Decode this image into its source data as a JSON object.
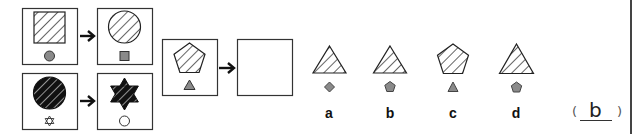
{
  "puzzle": {
    "type": "figure-reasoning",
    "examples": [
      {
        "source": {
          "main_shape": "square",
          "main_fill": "hatched",
          "small_shape": "circle",
          "small_fill": "gray"
        },
        "target": {
          "main_shape": "circle",
          "main_fill": "hatched",
          "small_shape": "square",
          "small_fill": "gray"
        }
      },
      {
        "source": {
          "main_shape": "circle",
          "main_fill": "black-hatched",
          "small_shape": "hexagram",
          "small_fill": "outline"
        },
        "target": {
          "main_shape": "hexagram",
          "main_fill": "black-hatched",
          "small_shape": "circle",
          "small_fill": "outline"
        }
      }
    ],
    "question": {
      "source": {
        "main_shape": "pentagon",
        "main_fill": "hatched",
        "small_shape": "triangle",
        "small_fill": "gray"
      },
      "target": "blank"
    },
    "options": [
      {
        "label": "a",
        "main_shape": "triangle",
        "small_shape": "diamond"
      },
      {
        "label": "b",
        "main_shape": "triangle",
        "small_shape": "pentagon"
      },
      {
        "label": "c",
        "main_shape": "pentagon",
        "small_shape": "triangle"
      },
      {
        "label": "d",
        "main_shape": "triangle",
        "small_shape": "pentagon"
      }
    ],
    "answer": {
      "open_paren": "(",
      "value": "b",
      "close_paren": ")"
    },
    "icons": {
      "arrow": "arrow-right-icon"
    },
    "colors": {
      "stroke": "#333333",
      "gray_fill": "#8a8a8a",
      "black_fill": "#111111"
    }
  }
}
